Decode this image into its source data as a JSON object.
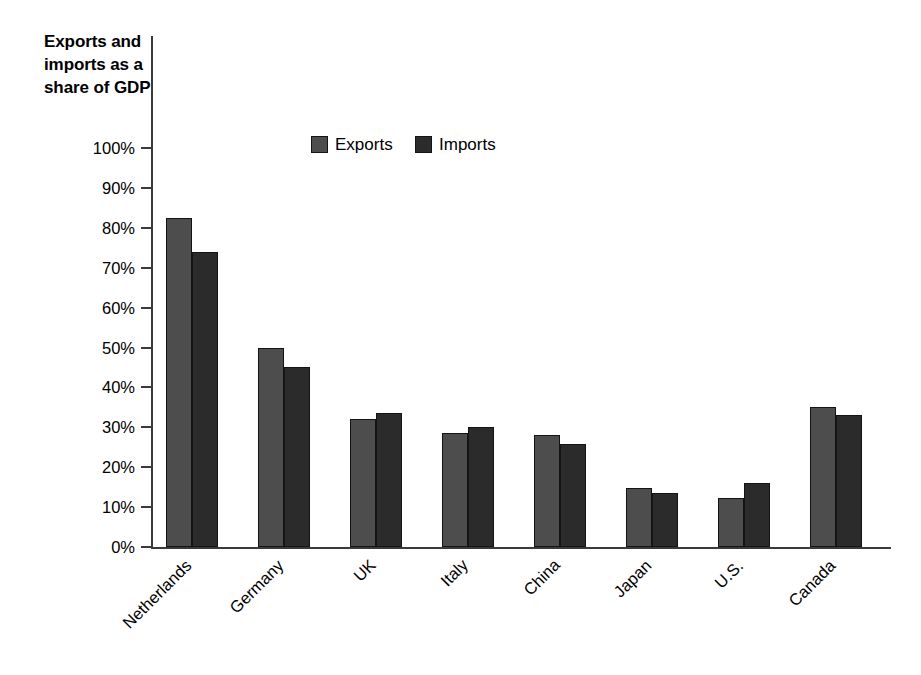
{
  "chart_data": {
    "type": "bar",
    "title": "Exports and imports as a share of GDP",
    "title_lines": [
      "Exports and",
      "imports as a",
      "share of GDP"
    ],
    "xlabel": "",
    "ylabel": "",
    "ylim": [
      0,
      100
    ],
    "y_unit": "%",
    "grid": false,
    "legend_position": "top-center",
    "categories": [
      "Netherlands",
      "Germany",
      "UK",
      "Italy",
      "China",
      "Japan",
      "U.S.",
      "Canada"
    ],
    "y_ticks": [
      0,
      10,
      20,
      30,
      40,
      50,
      60,
      70,
      80,
      90,
      100
    ],
    "y_tick_labels": [
      "0%",
      "10%",
      "20%",
      "30%",
      "40%",
      "50%",
      "60%",
      "70%",
      "80%",
      "90%",
      "100%"
    ],
    "series": [
      {
        "name": "Exports",
        "color": "#4d4d4d",
        "values": [
          82.5,
          50.0,
          32.0,
          28.5,
          28.0,
          14.8,
          12.3,
          35.0
        ]
      },
      {
        "name": "Imports",
        "color": "#2b2b2b",
        "values": [
          74.0,
          45.0,
          33.5,
          30.0,
          25.7,
          13.5,
          16.0,
          33.0
        ]
      }
    ]
  },
  "legend": {
    "items": [
      {
        "label": "Exports",
        "swatch": "exports"
      },
      {
        "label": "Imports",
        "swatch": "imports"
      }
    ]
  },
  "colors": {
    "exports": "#4d4d4d",
    "imports": "#2b2b2b",
    "axis": "#3a3a3a",
    "text": "#000000",
    "background": "#ffffff"
  }
}
